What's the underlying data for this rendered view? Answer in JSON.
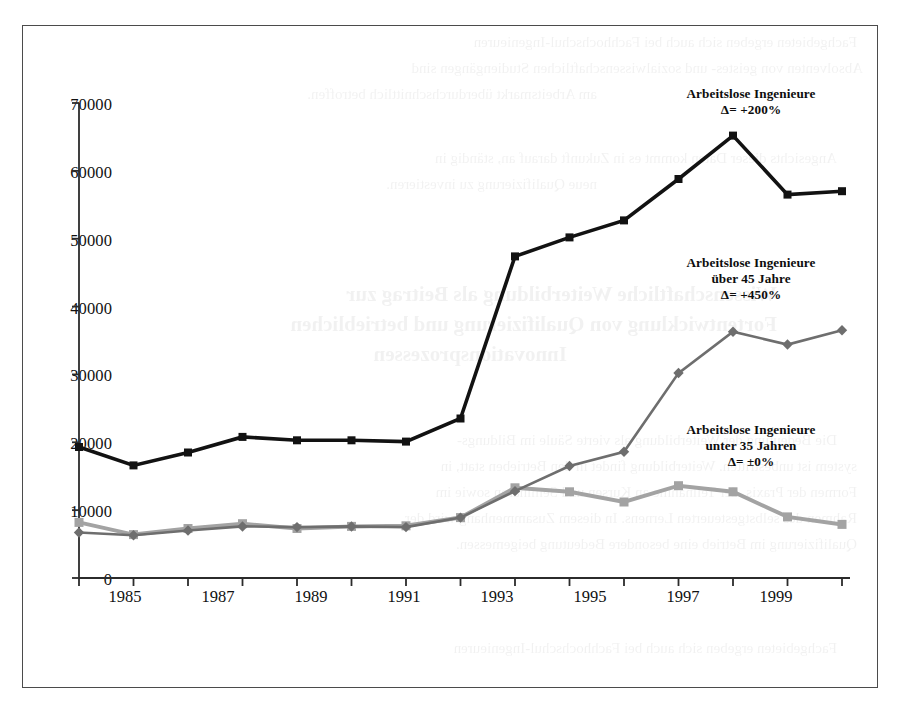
{
  "figure": {
    "frame_color": "#4b4b4b",
    "background": "#ffffff"
  },
  "axes": {
    "y_ticks": [
      "0",
      "10000",
      "20000",
      "30000",
      "40000",
      "50000",
      "60000",
      "70000"
    ],
    "x_ticks_labeled": [
      "1985",
      "1987",
      "1989",
      "1991",
      "1993",
      "1995",
      "1997",
      "1999"
    ]
  },
  "annotations": [
    {
      "id": "annot-gesamt",
      "line1": "Arbeitslose Ingenieure",
      "line2": "Δ= +200%",
      "line3": ""
    },
    {
      "id": "annot-ueber45",
      "line1": "Arbeitslose Ingenieure",
      "line2": "über 45 Jahre",
      "line3": "Δ= +450%"
    },
    {
      "id": "annot-unter35",
      "line1": "Arbeitslose Ingenieure",
      "line2": "unter 35 Jahren",
      "line3": "Δ= ±0%"
    }
  ],
  "bleed_text": {
    "l1": "Fachgebieten ergeben sich auch bei Fachhochschul-Ingenieuren",
    "l2": "Absolventen von geistes- und sozialwissenschaftlichen Studiengängen sind",
    "l3": "am Arbeitsmarkt überdurchschnittlich betroffen.",
    "l4": "Angesichts dieser Daten kommt es in Zukunft darauf an, ständig in",
    "l5": "neue Qualifizierung zu investieren.",
    "l6": "Wissenschaftliche Weiterbildung als Beitrag zur",
    "l7": "Fortentwicklung von Qualifizierung und betrieblichen",
    "l8": "Innovationsprozessen",
    "l9": "Die Bedeutung der Weiterbildung als vierte Säule im Bildungs-",
    "l10": "system ist unbestritten. Weiterbildung findet in den Betrieben statt, in",
    "l11": "Formen der Praxis, der Teilnahme an Kursen und Seminaren sowie im",
    "l12": "Rahmen des selbstgesteuerten Lernens. In diesem Zusammenhang wird der",
    "l13": "Qualifizierung im Betrieb eine besondere Bedeutung beigemessen."
  },
  "chart_data": {
    "type": "line",
    "title": "",
    "xlabel": "",
    "ylabel": "",
    "xlim": [
      1985,
      1999
    ],
    "ylim": [
      0,
      70000
    ],
    "grid": false,
    "legend": "annotations-inline",
    "x": [
      1985,
      1986,
      1987,
      1988,
      1989,
      1990,
      1991,
      1992,
      1993,
      1994,
      1995,
      1996,
      1997,
      1998,
      1999
    ],
    "series": [
      {
        "name": "Arbeitslose Ingenieure",
        "delta": "+200%",
        "color": "#121212",
        "marker": "square",
        "marker_size": 8,
        "line_width": 3.6,
        "values": [
          19300,
          16600,
          18500,
          20800,
          20300,
          20300,
          20100,
          23500,
          47400,
          50200,
          52700,
          58800,
          65200,
          56500,
          57000
        ]
      },
      {
        "name": "Arbeitslose Ingenieure über 45 Jahre",
        "delta": "+450%",
        "color": "#6e6e6e",
        "marker": "diamond",
        "marker_size": 8,
        "line_width": 2.6,
        "values": [
          6700,
          6300,
          7000,
          7600,
          7500,
          7600,
          7500,
          8900,
          12800,
          16500,
          18600,
          30200,
          36300,
          34400,
          36500
        ]
      },
      {
        "name": "Arbeitslose Ingenieure unter 35 Jahren",
        "delta": "±0%",
        "color": "#a3a3a3",
        "marker": "square",
        "marker_size": 9,
        "line_width": 4.0,
        "values": [
          8200,
          6400,
          7300,
          8000,
          7300,
          7600,
          7700,
          8900,
          13300,
          12700,
          11200,
          13600,
          12700,
          9000,
          7900
        ]
      }
    ]
  }
}
